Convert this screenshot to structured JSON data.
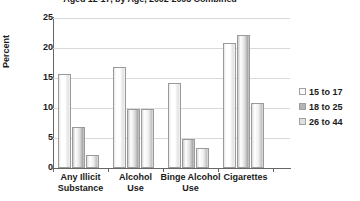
{
  "chart_data": {
    "type": "bar",
    "title": "Aged 12-17, by Age, 2002-2003 Combined",
    "xlabel": "",
    "ylabel": "Percent",
    "ylim": [
      0,
      25
    ],
    "yticks": [
      0,
      5,
      10,
      15,
      20,
      25
    ],
    "grid": true,
    "legend_position": "right",
    "categories": [
      "Any Illicit Substance",
      "Alcohol Use",
      "Binge Alcohol Use",
      "Cigarettes"
    ],
    "series": [
      {
        "name": "15 to 17",
        "values": [
          15.6,
          16.8,
          14.2,
          20.8
        ]
      },
      {
        "name": "18 to 25",
        "values": [
          6.9,
          9.9,
          4.8,
          22.2
        ]
      },
      {
        "name": "26 to 44",
        "values": [
          2.2,
          9.8,
          3.3,
          10.8
        ]
      }
    ]
  },
  "axis": {
    "y_title": "Percent",
    "y_tick_labels": [
      "25",
      "20",
      "15",
      "10",
      "5",
      "0"
    ]
  },
  "legend": {
    "items": [
      {
        "label": "15 to 17"
      },
      {
        "label": "18 to 25"
      },
      {
        "label": "26 to 44"
      }
    ]
  },
  "x_labels": [
    {
      "line1": "Any Illicit",
      "line2": "Substance"
    },
    {
      "line1": "Alcohol",
      "line2": "Use"
    },
    {
      "line1": "Binge Alcohol",
      "line2": "Use"
    },
    {
      "line1": "Cigarettes",
      "line2": ""
    }
  ]
}
